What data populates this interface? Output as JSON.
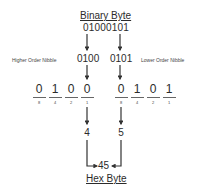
{
  "title_top": "Binary Byte",
  "byte_value": "01000101",
  "higher_nibble": {
    "label": "Higher Order Nibble",
    "value": "0100"
  },
  "lower_nibble": {
    "label": "Lower Order Nibble",
    "value": "0101"
  },
  "high_bits": [
    {
      "bit": "0",
      "weight": "8"
    },
    {
      "bit": "1",
      "weight": "4"
    },
    {
      "bit": "0",
      "weight": "2"
    },
    {
      "bit": "0",
      "weight": "1"
    }
  ],
  "low_bits": [
    {
      "bit": "0",
      "weight": "8"
    },
    {
      "bit": "1",
      "weight": "4"
    },
    {
      "bit": "0",
      "weight": "2"
    },
    {
      "bit": "1",
      "weight": "1"
    }
  ],
  "high_hex": "4",
  "low_hex": "5",
  "hex_value": "45",
  "title_bottom": "Hex Byte"
}
